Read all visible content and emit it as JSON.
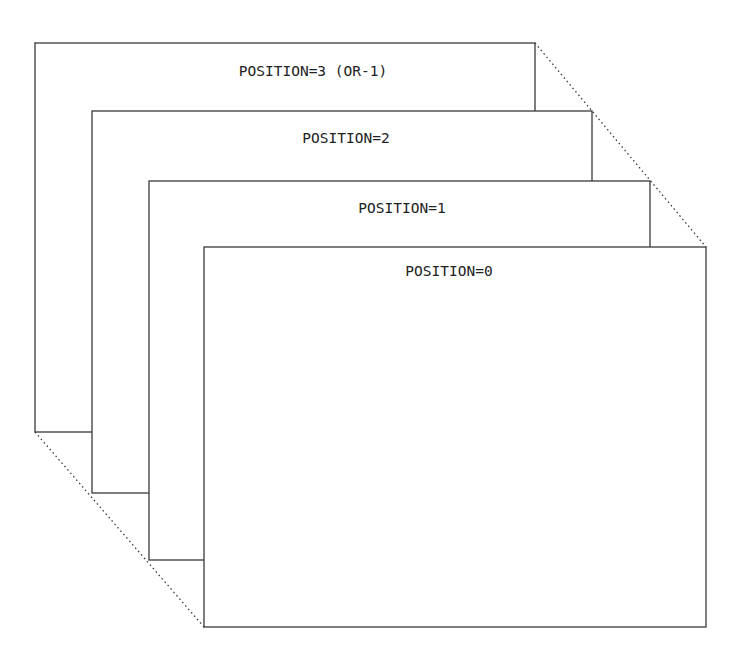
{
  "diagram": {
    "frames": [
      {
        "label": "POSITION=3 (OR-1)",
        "x": 35,
        "y": 43,
        "w": 500,
        "h": 389
      },
      {
        "label": "POSITION=2",
        "x": 92,
        "y": 111,
        "w": 500,
        "h": 382
      },
      {
        "label": "POSITION=1",
        "x": 149,
        "y": 181,
        "w": 501,
        "h": 379
      },
      {
        "label": "POSITION=0",
        "x": 204,
        "y": 247,
        "w": 502,
        "h": 380
      }
    ],
    "line_color": "#3a3a3a",
    "background": "#ffffff"
  }
}
